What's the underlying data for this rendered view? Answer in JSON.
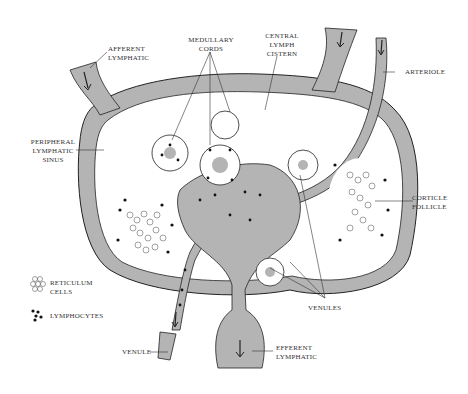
{
  "labels": {
    "afferent": [
      "AFFERENT",
      "LYMPHATIC"
    ],
    "medullary": [
      "MEDULLARY",
      "CORDS"
    ],
    "central": [
      "CENTRAL",
      "LYMPH",
      "CISTERN"
    ],
    "arteriole": "ARTERIOLE",
    "peripheral": [
      "PERIPHERAL",
      "LYMPHATIC",
      "SINUS"
    ],
    "cortical": [
      "CORTICLE",
      "FOLLICLE"
    ],
    "venules": "VENULES",
    "venule": "VENULE",
    "efferent": [
      "EFFERENT",
      "LYMPHATIC"
    ]
  },
  "legend": [
    {
      "icon": "reticulum-cells-icon",
      "label": [
        "RETICULUM",
        "CELLS"
      ]
    },
    {
      "icon": "lymphocytes-icon",
      "label": [
        "LYMPHOCYTES"
      ]
    }
  ],
  "colors": {
    "sinus": "#b4b4b4",
    "outline": "#222222",
    "background": "#ffffff"
  }
}
